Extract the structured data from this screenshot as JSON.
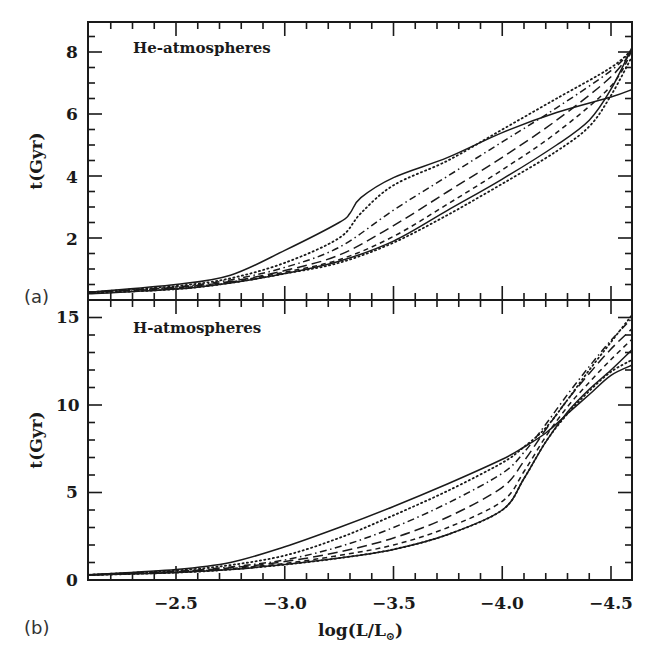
{
  "chart_data": [
    {
      "type": "line",
      "panel": "(a)",
      "title": "He-atmospheres",
      "xlabel": "log(L/L⊙)",
      "ylabel": "t(Gyr)",
      "xlim": [
        -2.1,
        -4.6
      ],
      "ylim": [
        0,
        9
      ],
      "x_ticks": [
        -2.5,
        -3.0,
        -3.5,
        -4.0,
        -4.5
      ],
      "y_ticks": [
        2,
        4,
        6,
        8
      ],
      "grid": false,
      "legend": "none",
      "series": [
        {
          "name": "solid-upper",
          "style": "solid",
          "x": [
            -2.1,
            -2.5,
            -2.75,
            -3.0,
            -3.25,
            -3.3,
            -3.35,
            -3.5,
            -3.75,
            -4.0,
            -4.25,
            -4.5,
            -4.6
          ],
          "y": [
            0.25,
            0.5,
            0.8,
            1.6,
            2.5,
            2.8,
            3.3,
            3.95,
            4.6,
            5.4,
            6.05,
            6.55,
            6.8
          ]
        },
        {
          "name": "dotted-upper",
          "style": "dotted",
          "x": [
            -2.1,
            -2.5,
            -2.75,
            -3.0,
            -3.25,
            -3.35,
            -3.5,
            -3.75,
            -4.0,
            -4.25,
            -4.5,
            -4.6
          ],
          "y": [
            0.25,
            0.45,
            0.7,
            1.2,
            2.0,
            2.8,
            3.7,
            4.5,
            5.5,
            6.5,
            7.5,
            8.1
          ]
        },
        {
          "name": "dash-dot",
          "style": "dashdot",
          "x": [
            -2.1,
            -2.5,
            -2.75,
            -3.0,
            -3.25,
            -3.5,
            -3.75,
            -4.0,
            -4.25,
            -4.5,
            -4.6
          ],
          "y": [
            0.25,
            0.42,
            0.65,
            1.05,
            1.7,
            2.9,
            4.0,
            5.1,
            6.2,
            7.4,
            8.1
          ]
        },
        {
          "name": "long-dash",
          "style": "longdash",
          "x": [
            -2.1,
            -2.5,
            -2.75,
            -3.0,
            -3.25,
            -3.5,
            -3.75,
            -4.0,
            -4.25,
            -4.5,
            -4.6
          ],
          "y": [
            0.25,
            0.4,
            0.6,
            0.95,
            1.45,
            2.4,
            3.5,
            4.6,
            5.8,
            7.2,
            8.1
          ]
        },
        {
          "name": "short-dash",
          "style": "shortdash",
          "x": [
            -2.1,
            -2.5,
            -2.75,
            -3.0,
            -3.25,
            -3.5,
            -3.75,
            -4.0,
            -4.25,
            -4.5,
            -4.6
          ],
          "y": [
            0.25,
            0.38,
            0.58,
            0.9,
            1.3,
            2.05,
            3.1,
            4.2,
            5.4,
            6.9,
            8.1
          ]
        },
        {
          "name": "dotted-lower",
          "style": "dotted",
          "x": [
            -2.1,
            -2.5,
            -2.75,
            -3.0,
            -3.25,
            -3.5,
            -3.75,
            -4.0,
            -4.25,
            -4.4,
            -4.5,
            -4.6
          ],
          "y": [
            0.22,
            0.35,
            0.55,
            0.85,
            1.2,
            1.85,
            2.75,
            3.75,
            4.8,
            5.6,
            6.6,
            7.9
          ]
        },
        {
          "name": "solid-lower",
          "style": "solid",
          "x": [
            -2.1,
            -2.5,
            -2.75,
            -3.0,
            -3.25,
            -3.5,
            -3.75,
            -4.0,
            -4.25,
            -4.4,
            -4.5,
            -4.6
          ],
          "y": [
            0.2,
            0.35,
            0.55,
            0.85,
            1.25,
            1.9,
            2.9,
            3.9,
            5.0,
            5.8,
            6.8,
            8.2
          ]
        }
      ]
    },
    {
      "type": "line",
      "panel": "(b)",
      "title": "H-atmospheres",
      "xlabel": "log(L/L⊙)",
      "ylabel": "t(Gyr)",
      "xlim": [
        -2.1,
        -4.6
      ],
      "ylim": [
        0,
        16
      ],
      "x_ticks": [
        -2.5,
        -3.0,
        -3.5,
        -4.0,
        -4.5
      ],
      "y_ticks": [
        0,
        5,
        10,
        15
      ],
      "grid": false,
      "legend": "none",
      "series": [
        {
          "name": "solid-upper",
          "style": "solid",
          "x": [
            -2.1,
            -2.5,
            -2.75,
            -3.0,
            -3.25,
            -3.5,
            -3.75,
            -4.0,
            -4.1,
            -4.2,
            -4.3,
            -4.4,
            -4.5,
            -4.6
          ],
          "y": [
            0.3,
            0.6,
            1.0,
            1.9,
            3.0,
            4.2,
            5.5,
            6.9,
            7.6,
            8.4,
            9.5,
            10.6,
            11.7,
            12.3
          ]
        },
        {
          "name": "dotted-upper",
          "style": "dotted",
          "x": [
            -2.1,
            -2.5,
            -2.75,
            -3.0,
            -3.25,
            -3.5,
            -3.75,
            -4.0,
            -4.1,
            -4.2,
            -4.3,
            -4.4,
            -4.5,
            -4.6
          ],
          "y": [
            0.3,
            0.55,
            0.85,
            1.4,
            2.4,
            3.7,
            5.1,
            6.7,
            7.6,
            8.7,
            10.3,
            12.0,
            13.6,
            15.2
          ]
        },
        {
          "name": "dash-dot",
          "style": "dashdot",
          "x": [
            -2.1,
            -2.5,
            -2.75,
            -3.0,
            -3.25,
            -3.5,
            -3.75,
            -4.0,
            -4.1,
            -4.2,
            -4.3,
            -4.4,
            -4.5,
            -4.6
          ],
          "y": [
            0.3,
            0.5,
            0.75,
            1.15,
            1.9,
            3.0,
            4.4,
            6.1,
            7.3,
            8.9,
            10.6,
            12.2,
            13.7,
            15.0
          ]
        },
        {
          "name": "long-dash",
          "style": "longdash",
          "x": [
            -2.1,
            -2.5,
            -2.75,
            -3.0,
            -3.25,
            -3.5,
            -3.75,
            -4.0,
            -4.1,
            -4.2,
            -4.3,
            -4.4,
            -4.5,
            -4.6
          ],
          "y": [
            0.3,
            0.48,
            0.7,
            1.05,
            1.6,
            2.4,
            3.6,
            5.3,
            6.8,
            8.6,
            10.3,
            11.8,
            13.2,
            14.4
          ]
        },
        {
          "name": "short-dash",
          "style": "shortdash",
          "x": [
            -2.1,
            -2.5,
            -2.75,
            -3.0,
            -3.25,
            -3.5,
            -3.75,
            -4.0,
            -4.1,
            -4.2,
            -4.3,
            -4.4,
            -4.5,
            -4.6
          ],
          "y": [
            0.3,
            0.45,
            0.65,
            0.95,
            1.4,
            2.0,
            3.0,
            4.5,
            6.2,
            8.2,
            9.9,
            11.3,
            12.6,
            13.8
          ]
        },
        {
          "name": "dotted-lower",
          "style": "dotted",
          "x": [
            -2.1,
            -2.5,
            -2.75,
            -3.0,
            -3.25,
            -3.5,
            -3.75,
            -4.0,
            -4.1,
            -4.2,
            -4.3,
            -4.4,
            -4.5,
            -4.6
          ],
          "y": [
            0.28,
            0.42,
            0.6,
            0.88,
            1.25,
            1.75,
            2.6,
            4.0,
            5.8,
            7.9,
            9.5,
            10.8,
            11.9,
            12.6
          ]
        },
        {
          "name": "solid-lower",
          "style": "solid",
          "x": [
            -2.1,
            -2.5,
            -2.75,
            -3.0,
            -3.25,
            -3.5,
            -3.75,
            -4.0,
            -4.1,
            -4.2,
            -4.3,
            -4.4,
            -4.5,
            -4.6
          ],
          "y": [
            0.28,
            0.42,
            0.6,
            0.88,
            1.25,
            1.75,
            2.6,
            4.0,
            5.8,
            7.9,
            9.6,
            10.9,
            12.0,
            13.2
          ]
        }
      ]
    }
  ],
  "labels": {
    "panel_a": "(a)",
    "panel_b": "(b)",
    "title_a": "He-atmospheres",
    "title_b": "H-atmospheres",
    "ylabel_a": "t(Gyr)",
    "ylabel_b": "t(Gyr)",
    "xlabel_main": "log(L/L",
    "xlabel_sub": "⊙",
    "xlabel_close": ")",
    "xticks": [
      "−2.5",
      "−3.0",
      "−3.5",
      "−4.0",
      "−4.5"
    ],
    "yticks_a": [
      "2",
      "4",
      "6",
      "8"
    ],
    "yticks_b": [
      "0",
      "5",
      "10",
      "15"
    ]
  },
  "colors": {
    "line": "#1a1a1a",
    "background": "#ffffff"
  }
}
